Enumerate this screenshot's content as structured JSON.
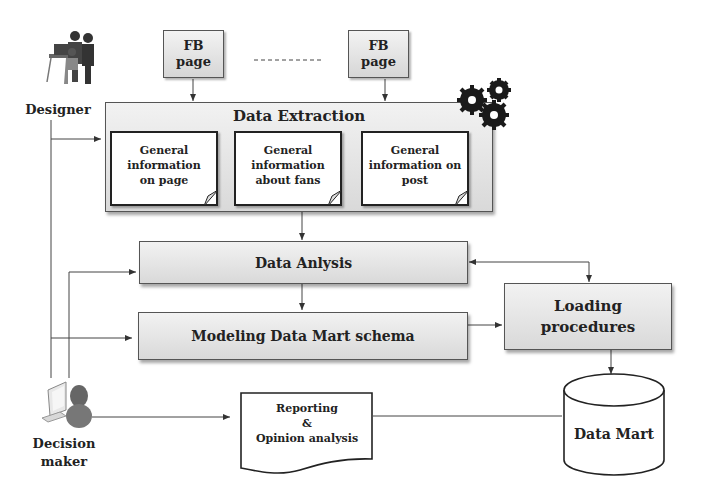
{
  "actors": {
    "designer": {
      "label": "Designer",
      "icon": "designer-team-icon"
    },
    "decision_maker": {
      "label_line1": "Decision",
      "label_line2": "maker",
      "icon": "user-computer-icon"
    }
  },
  "sources": {
    "fb_page_1": {
      "line1": "FB",
      "line2": "page"
    },
    "fb_page_2": {
      "line1": "FB",
      "line2": "page"
    }
  },
  "extraction": {
    "title": "Data Extraction",
    "icon": "gears-icon",
    "items": [
      {
        "line1": "General",
        "line2": "information",
        "line3": "on page"
      },
      {
        "line1": "General",
        "line2": "information",
        "line3": "about fans"
      },
      {
        "line1": "General",
        "line2": "information on",
        "line3": "post"
      }
    ]
  },
  "process": {
    "analysis": "Data Anlysis",
    "modeling": "Modeling Data Mart schema",
    "loading_line1": "Loading",
    "loading_line2": "procedures"
  },
  "outputs": {
    "report_line1": "Reporting",
    "report_line2": "&",
    "report_line3": "Opinion analysis",
    "datamart": "Data Mart"
  },
  "colors": {
    "line": "#444444",
    "box_top": "#f2f2f2",
    "box_bottom": "#d9d9d9"
  }
}
